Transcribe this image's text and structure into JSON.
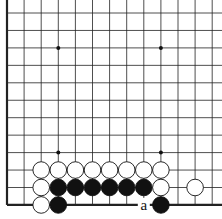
{
  "board": {
    "cols": 13,
    "rows": 12,
    "origin_x": 7,
    "origin_y": 13,
    "spacing_x": 17.1,
    "spacing_y": 17.45,
    "left_edge": true,
    "bottom_edge": true,
    "hoshi": [
      [
        3,
        2
      ],
      [
        9,
        2
      ],
      [
        3,
        8
      ],
      [
        9,
        8
      ]
    ],
    "stones": [
      {
        "c": 2,
        "r": 9,
        "color": "white"
      },
      {
        "c": 3,
        "r": 9,
        "color": "white"
      },
      {
        "c": 4,
        "r": 9,
        "color": "white"
      },
      {
        "c": 5,
        "r": 9,
        "color": "white"
      },
      {
        "c": 6,
        "r": 9,
        "color": "white"
      },
      {
        "c": 7,
        "r": 9,
        "color": "white"
      },
      {
        "c": 8,
        "r": 9,
        "color": "white"
      },
      {
        "c": 9,
        "r": 9,
        "color": "white"
      },
      {
        "c": 2,
        "r": 10,
        "color": "white"
      },
      {
        "c": 3,
        "r": 10,
        "color": "black"
      },
      {
        "c": 4,
        "r": 10,
        "color": "black"
      },
      {
        "c": 5,
        "r": 10,
        "color": "black"
      },
      {
        "c": 6,
        "r": 10,
        "color": "black"
      },
      {
        "c": 7,
        "r": 10,
        "color": "black"
      },
      {
        "c": 8,
        "r": 10,
        "color": "black"
      },
      {
        "c": 9,
        "r": 10,
        "color": "white"
      },
      {
        "c": 11,
        "r": 10,
        "color": "white"
      },
      {
        "c": 2,
        "r": 11,
        "color": "white"
      },
      {
        "c": 3,
        "r": 11,
        "color": "black"
      },
      {
        "c": 9,
        "r": 11,
        "color": "black"
      }
    ],
    "labels": [
      {
        "c": 8,
        "r": 11,
        "text": "a"
      }
    ]
  }
}
